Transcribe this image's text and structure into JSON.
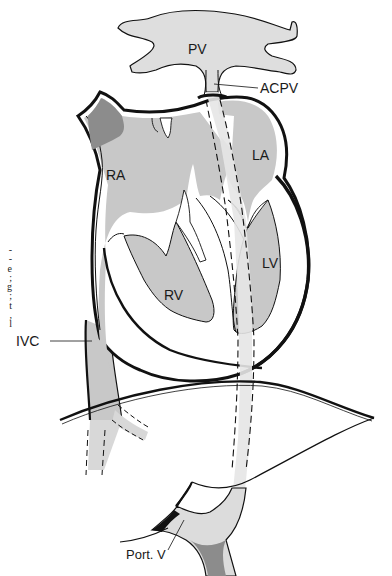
{
  "figure": {
    "type": "anatomical-diagram",
    "colors": {
      "chamber_fill": "#c8c8c8",
      "vessel_fill": "#dcdcdc",
      "catheter_fill": "#e6e6e6",
      "dark_region": "#8c8c8c",
      "outline": "#111111",
      "background": "#ffffff"
    }
  },
  "labels": {
    "pv": "PV",
    "acpv": "ACPV",
    "ra": "RA",
    "la": "LA",
    "lv": "LV",
    "rv": "RV",
    "ivc": "IVC",
    "port_v": "Port. V"
  },
  "caption_fragments": [
    "-",
    "-",
    "e",
    ";",
    "g",
    ";",
    "t",
    ",",
    "l"
  ]
}
